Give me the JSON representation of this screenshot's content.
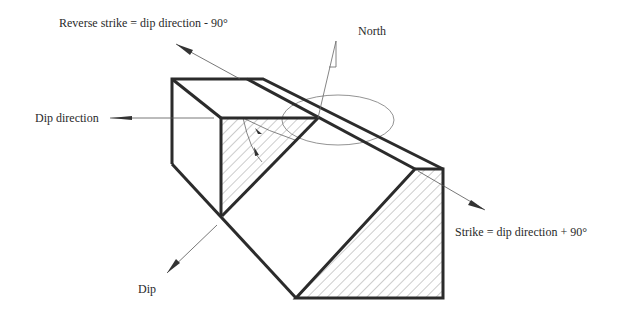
{
  "diagram": {
    "labels": {
      "reverse_strike": "Reverse strike = dip direction - 90°",
      "north": "North",
      "dip_direction": "Dip direction",
      "dip": "Dip",
      "strike": "Strike = dip direction +  90°"
    },
    "colors": {
      "outline": "#2b2b2b",
      "thin_line": "#555555",
      "hatch": "#9a9a9a",
      "background": "#ffffff"
    }
  }
}
